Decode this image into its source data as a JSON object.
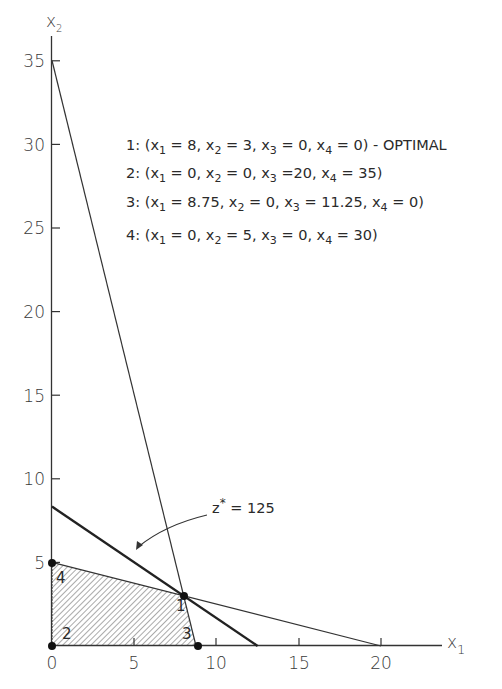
{
  "chart_data": {
    "type": "line",
    "title": "",
    "xlabel": "x1",
    "ylabel": "x2",
    "xlim": [
      0,
      24
    ],
    "ylim": [
      0,
      36
    ],
    "x_ticks": [
      0,
      5,
      10,
      15,
      20
    ],
    "y_ticks": [
      5,
      10,
      15,
      20,
      25,
      30,
      35
    ],
    "grid": false,
    "series": [
      {
        "name": "constraint 4x1 + x2 = 35",
        "points": [
          [
            0,
            35
          ],
          [
            8.75,
            0
          ]
        ],
        "style": "thin"
      },
      {
        "name": "constraint x1 + 4x2 = 20",
        "points": [
          [
            0,
            5
          ],
          [
            20,
            0
          ]
        ],
        "style": "thin"
      },
      {
        "name": "objective z* = 125",
        "points": [
          [
            0,
            8.33
          ],
          [
            12.5,
            0
          ]
        ],
        "style": "thick"
      }
    ],
    "feasible_region": {
      "vertices": [
        [
          0,
          0
        ],
        [
          0,
          5
        ],
        [
          8,
          3
        ],
        [
          8.75,
          0
        ]
      ],
      "fill": "hatched"
    },
    "corner_points": [
      {
        "id": "1",
        "x1": 8,
        "x2": 3
      },
      {
        "id": "2",
        "x1": 0,
        "x2": 0
      },
      {
        "id": "3",
        "x1": 8.75,
        "x2": 0
      },
      {
        "id": "4",
        "x1": 0,
        "x2": 5
      }
    ],
    "annotations": [
      {
        "text": "z* = 125",
        "points_to": "objective line"
      }
    ],
    "legend_position": "upper right (text block)"
  },
  "axes": {
    "x_label_main": "x",
    "x_label_sub": "1",
    "y_label_main": "x",
    "y_label_sub": "2",
    "x_ticks": [
      "0",
      "5",
      "10",
      "15",
      "20"
    ],
    "y_ticks": [
      "5",
      "10",
      "15",
      "20",
      "25",
      "30",
      "35"
    ]
  },
  "legend": [
    {
      "num": "1:",
      "parts": [
        [
          "x",
          "1",
          " = 8, "
        ],
        [
          "x",
          "2",
          " = 3, "
        ],
        [
          "x",
          "3",
          " = 0, "
        ],
        [
          "x",
          "4",
          " = 0)"
        ]
      ],
      "suffix": " - OPTIMAL"
    },
    {
      "num": "2:",
      "parts": [
        [
          "x",
          "1",
          " = 0, "
        ],
        [
          "x",
          "2",
          " = 0, "
        ],
        [
          "x",
          "3",
          " =20, "
        ],
        [
          "x",
          "4",
          " = 35)"
        ]
      ],
      "suffix": ""
    },
    {
      "num": "3:",
      "parts": [
        [
          "x",
          "1",
          " = 8.75, "
        ],
        [
          "x",
          "2",
          " = 0, "
        ],
        [
          "x",
          "3",
          " = 11.25, "
        ],
        [
          "x",
          "4",
          " = 0)"
        ]
      ],
      "suffix": ""
    },
    {
      "num": "4:",
      "parts": [
        [
          "x",
          "1",
          " = 0, "
        ],
        [
          "x",
          "2",
          " = 5, "
        ],
        [
          "x",
          "3",
          " = 0, "
        ],
        [
          "x",
          "4",
          " = 30)"
        ]
      ],
      "suffix": ""
    }
  ],
  "annotation": {
    "z_main": "z",
    "z_star": "*",
    "z_rest": " = 125"
  },
  "point_labels": [
    "1",
    "2",
    "3",
    "4"
  ],
  "colors": {
    "ink": "#222222",
    "axis": "#333333",
    "hatch": "#555555"
  }
}
